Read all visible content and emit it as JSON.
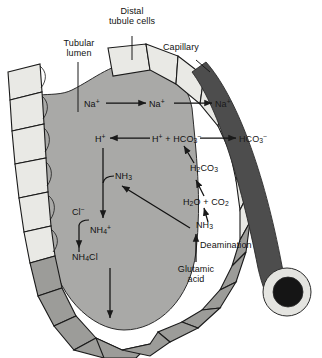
{
  "figure": {
    "type": "biological-schematic"
  },
  "colors": {
    "lumen_fill": "#a9a9a7",
    "cell_fill": "#e9e9e5",
    "cell_fill_dark": "#9a9a98",
    "cell_fill_mid": "#b4b4b1",
    "capillary_fill": "#4d4d4d",
    "capillary_rim": "#e4e4e0",
    "stroke": "#1a1a1a",
    "background": "#ffffff"
  },
  "labels": {
    "tubular_lumen": {
      "line1": "Tubular",
      "line2": "lumen"
    },
    "distal_tubule_cells": {
      "line1": "Distal",
      "line2": "tubule cells"
    },
    "capillary": "Capillary",
    "deamination": "Deamination",
    "glutamic_acid": {
      "line1": "Glutamic",
      "line2": "acid"
    }
  },
  "species": {
    "na_lumen": {
      "base": "Na",
      "sup": "+"
    },
    "na_cell": {
      "base": "Na",
      "sup": "+"
    },
    "na_capillary": {
      "base": "Na",
      "sup": "+"
    },
    "h_lumen": {
      "base": "H",
      "sup": "+"
    },
    "h_plus_hco3": {
      "h": "H",
      "h_sup": "+",
      "plus": " + ",
      "hco3": "HCO",
      "hco3_sub": "3",
      "hco3_sup": "−"
    },
    "hco3_capillary": {
      "base": "HCO",
      "sub": "3",
      "sup": "−"
    },
    "h2co3": {
      "h": "H",
      "h_sub": "2",
      "co3": "CO",
      "co3_sub": "3"
    },
    "h2o_co2": {
      "h2o": "H",
      "h2o_sub": "2",
      "o": "O",
      "plus": " + ",
      "co2": "CO",
      "co2_sub": "2"
    },
    "nh3_cell": {
      "base": "NH",
      "sub": "3"
    },
    "nh3_lumen": {
      "base": "NH",
      "sub": "3"
    },
    "nh4_plus": {
      "base": "NH",
      "sub": "4",
      "sup": "+"
    },
    "nh4cl": {
      "nh4": "NH",
      "nh4_sub": "4",
      "cl": "Cl"
    },
    "cl_minus": {
      "base": "Cl",
      "sup": "−"
    }
  }
}
